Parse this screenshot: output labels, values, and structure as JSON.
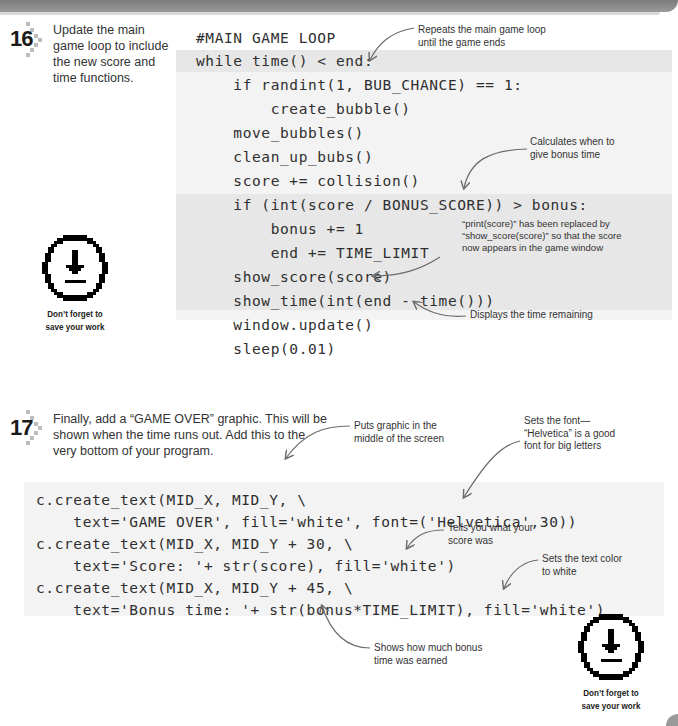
{
  "step16": {
    "number": "16",
    "instruction_lines": [
      "Update the main",
      "game loop to include",
      "the new score and",
      "time functions."
    ],
    "code": [
      "#MAIN GAME LOOP",
      "while time() < end:",
      "    if randint(1, BUB_CHANCE) == 1:",
      "        create_bubble()",
      "    move_bubbles()",
      "    clean_up_bubs()",
      "    score += collision()",
      "    if (int(score / BONUS_SCORE)) > bonus:",
      "        bonus += 1",
      "        end += TIME_LIMIT",
      "    show_score(score)",
      "    show_time(int(end - time()))",
      "    window.update()",
      "    sleep(0.01)"
    ],
    "annotations": {
      "loop": [
        "Repeats the main game loop",
        "until the game ends"
      ],
      "bonus": [
        "Calculates when to",
        "give bonus time"
      ],
      "show_score": [
        "“print(score)” has been replaced by",
        "“show_score(score)” so that the score",
        "now appears in the game window"
      ],
      "show_time": [
        "Displays the time remaining"
      ]
    }
  },
  "step17": {
    "number": "17",
    "instruction_lines": [
      "Finally, add a “GAME OVER” graphic. This will be",
      "shown when the time runs out. Add this to the",
      "very bottom of your program."
    ],
    "code": [
      "c.create_text(MID_X, MID_Y, \\",
      "    text='GAME OVER', fill='white', font=('Helvetica',30))",
      "c.create_text(MID_X, MID_Y + 30, \\",
      "    text='Score: '+ str(score), fill='white')",
      "c.create_text(MID_X, MID_Y + 45, \\",
      "    text='Bonus time: '+ str(bonus*TIME_LIMIT), fill='white')"
    ],
    "annotations": {
      "middle": [
        "Puts graphic in the",
        "middle of the screen"
      ],
      "font": [
        "Sets the font—",
        "“Helvetica” is a good",
        "font for big letters"
      ],
      "score": [
        "Tells you what your",
        "score was"
      ],
      "color": [
        "Sets the text color",
        "to white"
      ],
      "bonus": [
        "Shows how much bonus",
        "time was earned"
      ]
    }
  },
  "save_reminder": {
    "icon": "save-download-icon",
    "caption_lines": [
      "Don’t forget to",
      "save your work"
    ]
  },
  "colors": {
    "code_bg": "#f3f3f3",
    "highlight_bg": "#e7e7e7",
    "header_bar": "#8a8a8a"
  }
}
